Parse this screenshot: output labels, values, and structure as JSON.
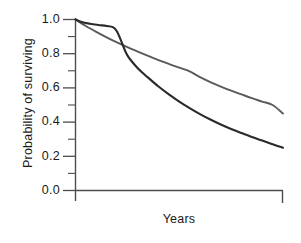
{
  "chart_data": {
    "type": "line",
    "title": "",
    "xlabel": "Years",
    "ylabel": "Probability of surviving",
    "grid": false,
    "legend": "none",
    "xlim": [
      0,
      10
    ],
    "ylim": [
      0.0,
      1.0
    ],
    "ytick_labels": [
      "1.0",
      "0.8",
      "0.6",
      "0.4",
      "0.2",
      "0.0"
    ],
    "ytick_values": [
      1.0,
      0.8,
      0.6,
      0.4,
      0.2,
      0.0
    ],
    "yminor_ticks": [
      0.9,
      0.7,
      0.5,
      0.3,
      0.1
    ],
    "xtick_labels": [],
    "axis_color": "#4d4d4d",
    "series": [
      {
        "name": "gray-curve",
        "color": "#5a5a5a",
        "linewidth": 1.9,
        "x": [
          0.0,
          0.5,
          1.0,
          1.5,
          2.0,
          2.5,
          3.0,
          3.5,
          4.0,
          4.5,
          5.0,
          5.5,
          6.0,
          6.5,
          7.0,
          7.5,
          8.0,
          8.5,
          9.0,
          9.5,
          10.0
        ],
        "values": [
          1.0,
          0.962,
          0.928,
          0.896,
          0.866,
          0.838,
          0.812,
          0.787,
          0.763,
          0.74,
          0.718,
          0.697,
          0.663,
          0.634,
          0.608,
          0.584,
          0.562,
          0.54,
          0.52,
          0.5,
          0.45
        ]
      },
      {
        "name": "dark-curve",
        "color": "#2a2a2a",
        "linewidth": 2.1,
        "x": [
          0.0,
          0.3,
          0.7,
          1.1,
          1.5,
          1.8,
          2.0,
          2.2,
          2.5,
          3.0,
          3.5,
          4.0,
          4.5,
          5.0,
          5.5,
          6.0,
          6.5,
          7.0,
          7.5,
          8.0,
          8.5,
          9.0,
          9.5,
          10.0
        ],
        "values": [
          1.0,
          0.985,
          0.975,
          0.968,
          0.962,
          0.955,
          0.93,
          0.875,
          0.79,
          0.715,
          0.66,
          0.608,
          0.562,
          0.52,
          0.482,
          0.447,
          0.415,
          0.386,
          0.36,
          0.336,
          0.313,
          0.292,
          0.27,
          0.25
        ]
      }
    ],
    "crossover": {
      "x": 3.55,
      "y": 0.667
    }
  },
  "axes": {
    "y_labels": [
      {
        "text": "1.0",
        "value": 1.0
      },
      {
        "text": "0.8",
        "value": 0.8
      },
      {
        "text": "0.6",
        "value": 0.6
      },
      {
        "text": "0.4",
        "value": 0.4
      },
      {
        "text": "0.2",
        "value": 0.2
      },
      {
        "text": "0.0",
        "value": 0.0
      }
    ],
    "y_title": "Probability of surviving",
    "x_title": "Years"
  }
}
